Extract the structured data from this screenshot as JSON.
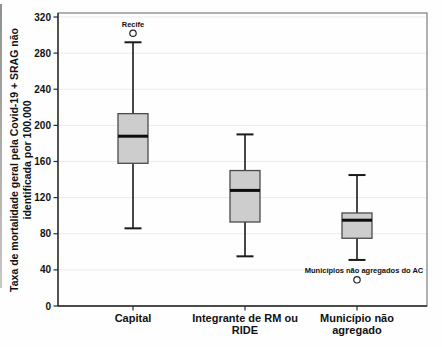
{
  "chart_data": {
    "type": "boxplot",
    "title": "",
    "xlabel": "",
    "ylabel_line1": "Taxa de mortalidade geral pela Covid-19 + SRAG não",
    "ylabel_line2": "identificada por 100.000",
    "ylim": [
      0,
      320
    ],
    "yticks": [
      0,
      40,
      80,
      120,
      160,
      200,
      240,
      280,
      320
    ],
    "grid": "horizontal-light",
    "legend": "none",
    "categories": [
      {
        "label": "Capital",
        "label_lines": [
          "Capital"
        ],
        "whisker_low": 86,
        "q1": 158,
        "median": 188,
        "q3": 213,
        "whisker_high": 292,
        "outliers": [
          {
            "label": "Recife",
            "value": 302
          }
        ]
      },
      {
        "label": "Integrante de RM ou RIDE",
        "label_lines": [
          "Integrante de RM ou",
          "RIDE"
        ],
        "whisker_low": 55,
        "q1": 93,
        "median": 128,
        "q3": 150,
        "whisker_high": 190,
        "outliers": []
      },
      {
        "label": "Município não agregado",
        "label_lines": [
          "Município não",
          "agregado"
        ],
        "whisker_low": 51,
        "q1": 75,
        "median": 95,
        "q3": 103,
        "whisker_high": 145,
        "outliers": [
          {
            "label": "Municípios não agregados do AC",
            "value": 29
          }
        ]
      }
    ],
    "colors": {
      "box_fill": "#cdcdcd",
      "box_border": "#4a4a4a",
      "median": "#0d0d0d",
      "whisker": "#1a1a1a",
      "frame": "#7d7d7d",
      "axis": "#2b2b2b",
      "grid": "#ebebeb",
      "text": "#111111",
      "outlier_stroke": "#222222",
      "background": "#fefefe"
    }
  }
}
